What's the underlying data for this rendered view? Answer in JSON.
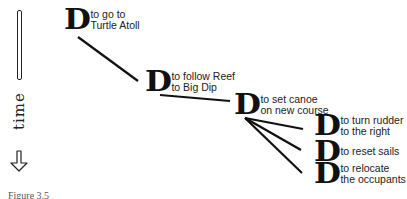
{
  "axis": {
    "label": "time",
    "arrow_icon": "down-arrow-icon"
  },
  "nodes": [
    {
      "id": "n1",
      "glyph": "D",
      "text": "to go to\nTurtle Atoll"
    },
    {
      "id": "n2",
      "glyph": "D",
      "text": "to follow Reef\nto Big Dip"
    },
    {
      "id": "n3",
      "glyph": "D",
      "text": "to set canoe\non new course"
    },
    {
      "id": "n4",
      "glyph": "D",
      "text": "to turn rudder\nto the right"
    },
    {
      "id": "n5",
      "glyph": "D",
      "text": "to reset sails"
    },
    {
      "id": "n6",
      "glyph": "D",
      "text": "to relocate\nthe occupants"
    }
  ],
  "edges": [
    {
      "from": "n1",
      "to": "n2"
    },
    {
      "from": "n2",
      "to": "n3"
    },
    {
      "from": "n3",
      "to": "n4"
    },
    {
      "from": "n3",
      "to": "n5"
    },
    {
      "from": "n3",
      "to": "n6"
    }
  ],
  "caption": "Figure 3.5"
}
